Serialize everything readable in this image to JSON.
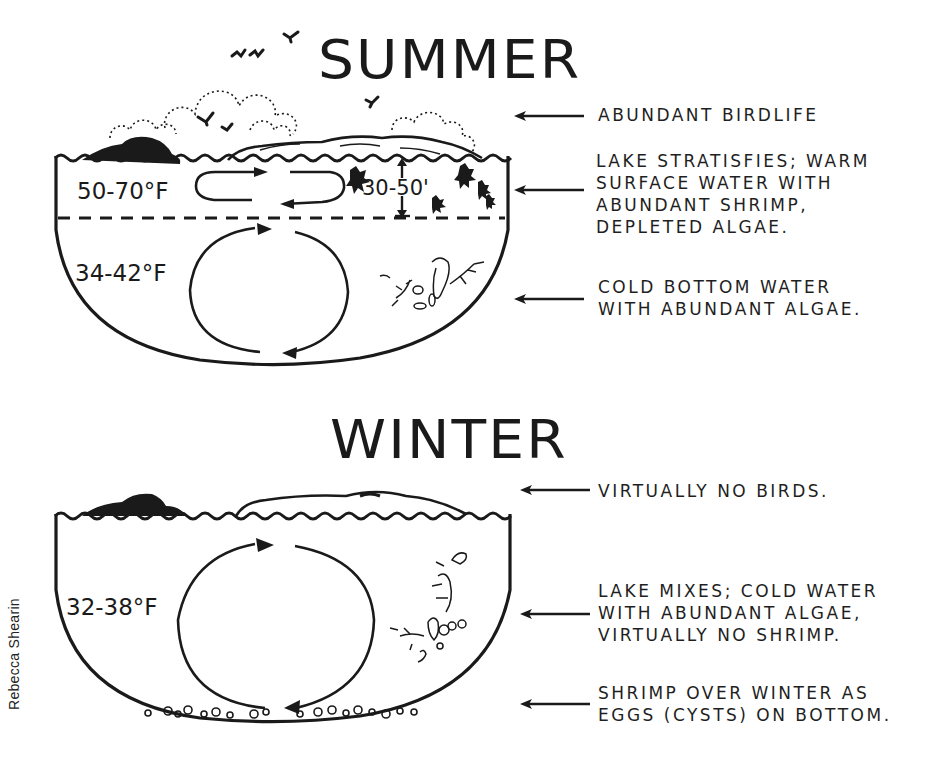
{
  "diagram": {
    "credit": "Rebecca Shearin",
    "panels": [
      {
        "title": "SUMMER",
        "temperatures": {
          "upper_layer": "50-70°F",
          "upper_layer_depth": "30-50'",
          "lower_layer": "34-42°F"
        },
        "annotations": [
          {
            "lines": [
              "ABUNDANT BIRDLIFE"
            ]
          },
          {
            "lines": [
              "LAKE STRATISFIES; WARM",
              "SURFACE WATER WITH",
              "ABUNDANT SHRIMP,",
              "DEPLETED ALGAE."
            ]
          },
          {
            "lines": [
              "COLD BOTTOM WATER",
              "WITH ABUNDANT ALGAE."
            ]
          }
        ]
      },
      {
        "title": "WINTER",
        "temperatures": {
          "whole_lake": "32-38°F"
        },
        "annotations": [
          {
            "lines": [
              "VIRTUALLY NO BIRDS."
            ]
          },
          {
            "lines": [
              "LAKE MIXES; COLD WATER",
              "WITH ABUNDANT ALGAE,",
              "VIRTUALLY NO SHRIMP."
            ]
          },
          {
            "lines": [
              "SHRIMP OVER WINTER AS",
              "EGGS (CYSTS) ON BOTTOM."
            ]
          }
        ]
      }
    ],
    "colors": {
      "ink": "#1a1a1a",
      "paper": "#ffffff"
    }
  }
}
